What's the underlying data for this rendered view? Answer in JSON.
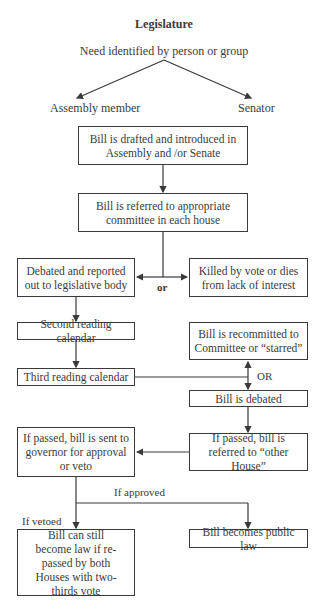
{
  "title": "Legislature",
  "origin": "Need identified by person or group",
  "branches": {
    "left": "Assembly member",
    "right": "Senator"
  },
  "nodes": {
    "drafted": "Bill is drafted and introduced in Assembly and /or Senate",
    "referred": "Bill is referred to appropriate committee in each house",
    "debated_reported": "Debated and reported out to legislative body",
    "killed": "Killed by vote or dies from lack of interest",
    "second_reading": "Second reading calendar",
    "recommitted": "Bill is recommitted to Committee or “starred”",
    "third_reading": "Third reading calendar",
    "bill_debated": "Bill is debated",
    "to_governor": "If passed, bill is sent to governor for approval or veto",
    "other_house": "If passed, bill is referred to “other House”",
    "veto_override": "Bill can still become law if re-passed by both Houses with two-thirds vote",
    "public_law": "Bill becomes public law"
  },
  "edge_labels": {
    "or_lower": "or",
    "or_upper": "OR",
    "if_approved": "If approved",
    "if_vetoed": "If vetoed"
  },
  "colors": {
    "line": "#3a3a3a",
    "background": "#ffffff"
  }
}
